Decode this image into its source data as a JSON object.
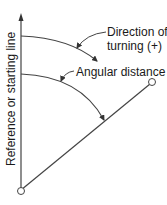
{
  "diagram": {
    "reference_line_label": "Reference or starting line",
    "direction_label_line1": "Direction of",
    "direction_label_line2": "turning (+)",
    "angular_distance_label": "Angular distance",
    "colors": {
      "line": "#444444",
      "text": "#1a1a1a",
      "background": "#ffffff"
    }
  }
}
